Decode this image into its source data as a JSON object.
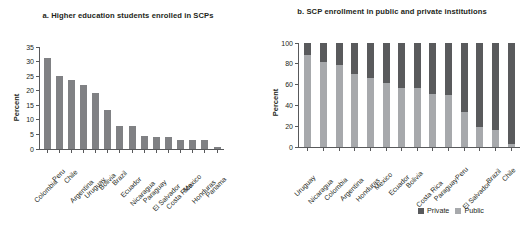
{
  "figure": {
    "background": "#ffffff",
    "colors": {
      "bar": "#808184",
      "private": "#595a5c",
      "public": "#a7a9ac",
      "axis": "#58595b",
      "text": "#231f20"
    }
  },
  "panel_a": {
    "title": "a. Higher education students enrolled in SCPs",
    "ylabel": "Percent",
    "yticks": [
      "0",
      "5",
      "10",
      "15",
      "20",
      "25",
      "30",
      "35"
    ]
  },
  "panel_b": {
    "title": "b. SCP enrollment in public and private institutions",
    "ylabel": "Percent",
    "yticks": [
      "0",
      "20",
      "40",
      "60",
      "80",
      "100"
    ],
    "legend": [
      {
        "label": "Private",
        "color": "#595a5c"
      },
      {
        "label": "Public",
        "color": "#a7a9ac"
      }
    ]
  },
  "chart_data": [
    {
      "type": "bar",
      "title": "a. Higher education students enrolled in SCPs",
      "xlabel": "",
      "ylabel": "Percent",
      "ylim": [
        0,
        35
      ],
      "yticks": [
        0,
        5,
        10,
        15,
        20,
        25,
        30,
        35
      ],
      "grid": false,
      "categories": [
        "Colombia",
        "Peru",
        "Chile",
        "Argentina",
        "Uruguay",
        "Bolivia",
        "Brazil",
        "Ecuador",
        "Nicaragua",
        "Paraguay",
        "El Salvador",
        "Costa Rica",
        "Mexico",
        "Honduras",
        "Panama"
      ],
      "values": [
        31.4,
        25.1,
        23.6,
        22.1,
        19.1,
        13.3,
        8.0,
        7.9,
        4.3,
        4.1,
        4.0,
        3.2,
        3.1,
        3.0,
        0.8
      ]
    },
    {
      "type": "bar",
      "subtype": "stacked-100",
      "title": "b. SCP enrollment in public and private institutions",
      "xlabel": "",
      "ylabel": "Percent",
      "ylim": [
        0,
        100
      ],
      "yticks": [
        0,
        20,
        40,
        60,
        80,
        100
      ],
      "grid": false,
      "legend_position": "bottom-right",
      "categories": [
        "Uruguay",
        "Nicaragua",
        "Colombia",
        "Argentina",
        "Honduras",
        "Mexico",
        "Ecuador",
        "Bolivia",
        "Costa Rica",
        "Paraguay",
        "Peru",
        "El Salvador",
        "Brazil",
        "Chile"
      ],
      "series": [
        {
          "name": "Public",
          "color": "#a7a9ac",
          "values": [
            88,
            82,
            79,
            70,
            66,
            62,
            57,
            57,
            51,
            50,
            34,
            19,
            16,
            3
          ]
        },
        {
          "name": "Private",
          "color": "#595a5c",
          "values": [
            12,
            18,
            21,
            30,
            34,
            38,
            43,
            43,
            49,
            50,
            66,
            81,
            84,
            97
          ]
        }
      ]
    }
  ]
}
